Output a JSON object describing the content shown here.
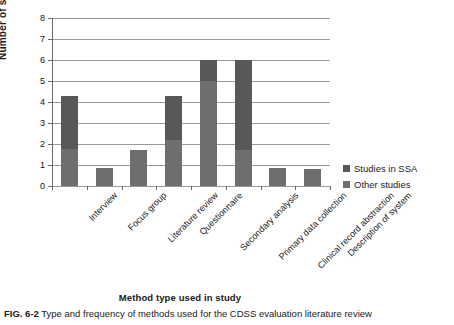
{
  "figure": {
    "caption_label": "FIG. 6-2",
    "caption_text": "Type and frequency of methods used for the CDSS evaluation literature review"
  },
  "legend": {
    "position": "right",
    "items": [
      {
        "label": "Studies in SSA",
        "color": "#585858"
      },
      {
        "label": "Other studies",
        "color": "#6e6e6e"
      }
    ]
  },
  "chart_data": {
    "type": "bar",
    "stacked": true,
    "title": "",
    "xlabel": "Method type used in study",
    "ylabel": "Number of studies",
    "ylim": [
      0,
      8
    ],
    "yticks": [
      "0",
      "1",
      "2",
      "3",
      "4",
      "5",
      "6",
      "7",
      "8"
    ],
    "grid": true,
    "categories": [
      "Interview",
      "Focus group",
      "Literature review",
      "Questionnaire",
      "Secondary analysis",
      "Primary data collection",
      "Clinical record abstraction",
      "Description of system"
    ],
    "series": [
      {
        "name": "Other studies",
        "color": "#6e6e6e",
        "values": [
          1.75,
          0.85,
          1.7,
          2.2,
          5.0,
          1.7,
          0.85,
          0.8
        ]
      },
      {
        "name": "Studies in SSA",
        "color": "#585858",
        "values": [
          2.55,
          0.0,
          0.0,
          2.1,
          1.0,
          4.3,
          0.0,
          0.0
        ]
      }
    ],
    "totals": [
      4.3,
      0.85,
      1.7,
      4.3,
      6.0,
      6.0,
      0.85,
      0.8
    ]
  }
}
